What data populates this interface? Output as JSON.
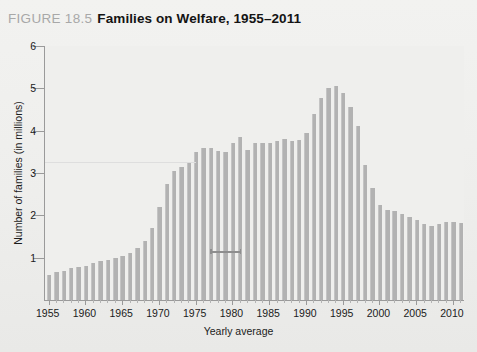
{
  "header": {
    "figure_number": "FIGURE 18.5",
    "title": "Families on Welfare, 1955–2011"
  },
  "axes": {
    "y_title": "Number of families (in millions)",
    "x_title": "Yearly average",
    "y_ticks": [
      "1",
      "2",
      "3",
      "4",
      "5",
      "6"
    ],
    "x_ticks": [
      "1955",
      "1960",
      "1965",
      "1970",
      "1975",
      "1980",
      "1985",
      "1990",
      "1995",
      "2000",
      "2005",
      "2010"
    ]
  },
  "colors": {
    "bar": "#b2b2b2",
    "plot_background": "#efefed",
    "page_background": "#eeeeec",
    "axis": "#9a9a9a",
    "figure_number": "#a8a8a8",
    "title": "#141414",
    "reference_line": "#dedede",
    "marker": "#8e8e8e"
  },
  "chart_data": {
    "type": "bar",
    "title": "Families on Welfare, 1955–2011",
    "xlabel": "Yearly average",
    "ylabel": "Number of families (in millions)",
    "ylim": [
      0,
      6
    ],
    "xlim": [
      1955,
      2011
    ],
    "grid": false,
    "legend": "none",
    "categories": [
      "1955",
      "1956",
      "1957",
      "1958",
      "1959",
      "1960",
      "1961",
      "1962",
      "1963",
      "1964",
      "1965",
      "1966",
      "1967",
      "1968",
      "1969",
      "1970",
      "1971",
      "1972",
      "1973",
      "1974",
      "1975",
      "1976",
      "1977",
      "1978",
      "1979",
      "1980",
      "1981",
      "1982",
      "1983",
      "1984",
      "1985",
      "1986",
      "1987",
      "1988",
      "1989",
      "1990",
      "1991",
      "1992",
      "1993",
      "1994",
      "1995",
      "1996",
      "1997",
      "1998",
      "1999",
      "2000",
      "2001",
      "2002",
      "2003",
      "2004",
      "2005",
      "2006",
      "2007",
      "2008",
      "2009",
      "2010",
      "2011"
    ],
    "values": [
      0.6,
      0.65,
      0.68,
      0.75,
      0.78,
      0.8,
      0.88,
      0.93,
      0.95,
      1.0,
      1.05,
      1.1,
      1.22,
      1.4,
      1.7,
      2.2,
      2.75,
      3.05,
      3.15,
      3.25,
      3.5,
      3.58,
      3.58,
      3.52,
      3.5,
      3.72,
      3.85,
      3.55,
      3.7,
      3.72,
      3.7,
      3.75,
      3.8,
      3.75,
      3.78,
      3.95,
      4.4,
      4.77,
      5.0,
      5.05,
      4.88,
      4.55,
      4.1,
      3.2,
      2.65,
      2.25,
      2.12,
      2.1,
      2.03,
      1.95,
      1.9,
      1.8,
      1.75,
      1.8,
      1.85,
      1.85,
      1.82
    ],
    "annotations": [
      {
        "name": "reference-line",
        "value": 3.25,
        "x_start": 1955,
        "x_end": 1975
      },
      {
        "name": "marker",
        "value": 1.15,
        "x_start": 1977,
        "x_end": 1981
      }
    ]
  }
}
